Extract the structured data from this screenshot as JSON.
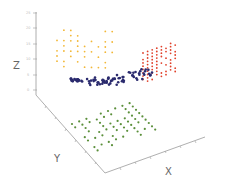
{
  "chart_data": {
    "type": "scatter",
    "dimensions": 3,
    "title": "",
    "xlabel": "X",
    "ylabel": "Y",
    "zlabel": "Z",
    "z_ticks": [
      "0",
      "5",
      "10",
      "15",
      "20",
      "25"
    ],
    "zlim": [
      0,
      25
    ],
    "grid": false,
    "legend": null,
    "series": [
      {
        "name": "orange-cluster",
        "color": "#f2b736",
        "description": "vertical sheet of points, upper left, z≈10–25"
      },
      {
        "name": "red-cluster",
        "color": "#e0402a",
        "description": "vertical sheet of points, right side, z≈8–18"
      },
      {
        "name": "navy-cluster",
        "color": "#2b2b6e",
        "description": "curved band of points through the middle, z≈5–10"
      },
      {
        "name": "green-cluster",
        "color": "#5a8f3a",
        "description": "flat grid of points on the floor plane, z≈0"
      }
    ]
  },
  "axes": {
    "x_label": "X",
    "y_label": "Y",
    "z_label": "Z"
  }
}
